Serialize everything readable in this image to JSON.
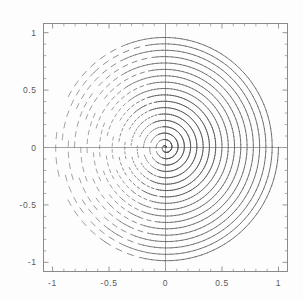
{
  "figure": {
    "name": "archimedean-spiral-plot",
    "background_color": "#fdfdfd",
    "frame_color": "#8a8a8a",
    "curve_color": "#555555",
    "axis_color": "#9a9a9a",
    "label_color": "#5a5a5a"
  },
  "axes": {
    "x_labels": [
      "-1",
      "-0.5",
      "0",
      "0.5",
      "1"
    ],
    "y_labels": [
      "1",
      "0.5",
      "0",
      "-0.5",
      "-1"
    ],
    "x_values": [
      -1,
      -0.5,
      0,
      0.5,
      1
    ],
    "y_values": [
      1,
      0.5,
      0,
      -0.5,
      -1
    ],
    "frame": true,
    "ticks_inward": true,
    "minor_ticks_per_interval": 5
  },
  "chart_data": {
    "type": "line",
    "title": "",
    "xlabel": "",
    "ylabel": "",
    "xlim": [
      -1.08,
      1.08
    ],
    "ylim": [
      -1.08,
      1.08
    ],
    "grid": false,
    "legend": null,
    "curve": {
      "name": "spiral",
      "equation": "x = (t/tmax)*cos(t), y = (t/tmax)*sin(t)",
      "turns": 18,
      "t_start": 0,
      "t_end": 113.1,
      "samples": 2000,
      "r_start": 0,
      "r_end": 1
    },
    "axis_lines": {
      "x_axis_y": 0,
      "y_axis_x": 0
    },
    "categories": [
      "-1",
      "-0.5",
      "0",
      "0.5",
      "1"
    ],
    "values": [
      -1,
      -0.5,
      0,
      0.5,
      1
    ]
  }
}
